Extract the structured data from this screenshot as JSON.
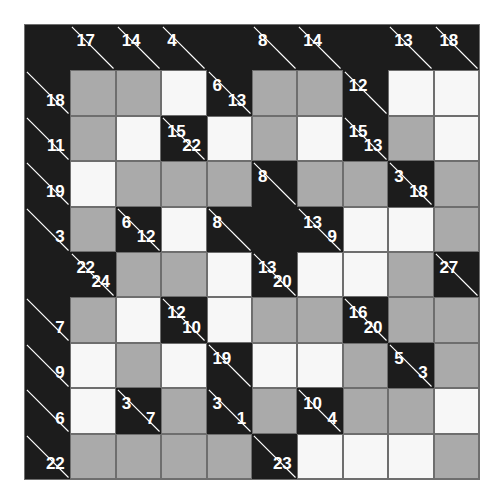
{
  "puzzle": {
    "name": "Kakuro",
    "type": "kakuro-grid",
    "rows": 10,
    "cols": 10,
    "cell_size": 45.4,
    "colors": {
      "background": "#ffffff",
      "block": "#1c1c1c",
      "cell_white": "#f7f7f7",
      "cell_gray": "#aaaaaa",
      "grid_line": "#6e6e6e",
      "clue_text": "#ffffff",
      "diagonal": "#ffffff"
    },
    "legend": {
      "block_label": "block-cell",
      "clue_label": "clue-cell",
      "white_label": "open-cell-white",
      "gray_label": "open-cell-gray"
    },
    "grid": [
      [
        {
          "kind": "block"
        },
        {
          "kind": "clue",
          "down": "17"
        },
        {
          "kind": "clue",
          "down": "14"
        },
        {
          "kind": "clue",
          "down": "4"
        },
        {
          "kind": "block"
        },
        {
          "kind": "clue",
          "down": "8"
        },
        {
          "kind": "clue",
          "down": "14"
        },
        {
          "kind": "block"
        },
        {
          "kind": "clue",
          "down": "13"
        },
        {
          "kind": "clue",
          "down": "18"
        }
      ],
      [
        {
          "kind": "clue",
          "across": "18"
        },
        {
          "kind": "gray"
        },
        {
          "kind": "gray"
        },
        {
          "kind": "white"
        },
        {
          "kind": "clue",
          "across": "13",
          "down": "6"
        },
        {
          "kind": "gray"
        },
        {
          "kind": "gray"
        },
        {
          "kind": "clue",
          "down": "12"
        },
        {
          "kind": "white"
        },
        {
          "kind": "white"
        }
      ],
      [
        {
          "kind": "clue",
          "across": "11"
        },
        {
          "kind": "gray"
        },
        {
          "kind": "white"
        },
        {
          "kind": "clue",
          "across": "22",
          "down": "15"
        },
        {
          "kind": "white"
        },
        {
          "kind": "gray"
        },
        {
          "kind": "white"
        },
        {
          "kind": "clue",
          "across": "13",
          "down": "15"
        },
        {
          "kind": "gray"
        },
        {
          "kind": "white"
        }
      ],
      [
        {
          "kind": "clue",
          "across": "19"
        },
        {
          "kind": "white"
        },
        {
          "kind": "gray"
        },
        {
          "kind": "gray"
        },
        {
          "kind": "gray"
        },
        {
          "kind": "clue",
          "down": "8"
        },
        {
          "kind": "gray"
        },
        {
          "kind": "gray"
        },
        {
          "kind": "clue",
          "across": "18",
          "down": "3"
        },
        {
          "kind": "gray"
        }
      ],
      [
        {
          "kind": "clue",
          "across": "3"
        },
        {
          "kind": "gray"
        },
        {
          "kind": "clue",
          "across": "12",
          "down": "6"
        },
        {
          "kind": "white"
        },
        {
          "kind": "clue",
          "down": "8"
        },
        {
          "kind": "block"
        },
        {
          "kind": "clue",
          "across": "9",
          "down": "13"
        },
        {
          "kind": "white"
        },
        {
          "kind": "white"
        },
        {
          "kind": "gray"
        }
      ],
      [
        {
          "kind": "block"
        },
        {
          "kind": "clue",
          "across": "24",
          "down": "22"
        },
        {
          "kind": "gray"
        },
        {
          "kind": "gray"
        },
        {
          "kind": "white"
        },
        {
          "kind": "clue",
          "across": "20",
          "down": "13"
        },
        {
          "kind": "white"
        },
        {
          "kind": "white"
        },
        {
          "kind": "gray"
        },
        {
          "kind": "clue",
          "down": "27"
        }
      ],
      [
        {
          "kind": "clue",
          "across": "7"
        },
        {
          "kind": "gray"
        },
        {
          "kind": "white"
        },
        {
          "kind": "clue",
          "across": "10",
          "down": "12"
        },
        {
          "kind": "white"
        },
        {
          "kind": "gray"
        },
        {
          "kind": "gray"
        },
        {
          "kind": "clue",
          "across": "20",
          "down": "16"
        },
        {
          "kind": "gray"
        },
        {
          "kind": "gray"
        }
      ],
      [
        {
          "kind": "clue",
          "across": "9"
        },
        {
          "kind": "white"
        },
        {
          "kind": "gray"
        },
        {
          "kind": "white"
        },
        {
          "kind": "clue",
          "down": "19"
        },
        {
          "kind": "white"
        },
        {
          "kind": "white"
        },
        {
          "kind": "gray"
        },
        {
          "kind": "clue",
          "across": "3",
          "down": "5"
        },
        {
          "kind": "gray"
        }
      ],
      [
        {
          "kind": "clue",
          "across": "6"
        },
        {
          "kind": "white"
        },
        {
          "kind": "clue",
          "across": "7",
          "down": "3"
        },
        {
          "kind": "gray"
        },
        {
          "kind": "clue",
          "across": "1",
          "down": "3"
        },
        {
          "kind": "gray"
        },
        {
          "kind": "clue",
          "across": "4",
          "down": "10"
        },
        {
          "kind": "gray"
        },
        {
          "kind": "gray"
        },
        {
          "kind": "white"
        }
      ],
      [
        {
          "kind": "clue",
          "across": "22"
        },
        {
          "kind": "gray"
        },
        {
          "kind": "gray"
        },
        {
          "kind": "gray"
        },
        {
          "kind": "gray"
        },
        {
          "kind": "clue",
          "across": "23"
        },
        {
          "kind": "white"
        },
        {
          "kind": "white"
        },
        {
          "kind": "white"
        },
        {
          "kind": "gray"
        }
      ]
    ]
  }
}
